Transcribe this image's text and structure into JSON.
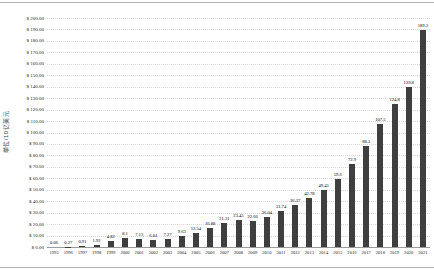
{
  "chart_data": {
    "type": "bar",
    "title": "",
    "xlabel": "",
    "ylabel": "单位/10亿美元",
    "categories": [
      "1995",
      "1996",
      "1997",
      "1998",
      "1999",
      "2000",
      "2001",
      "2002",
      "2003",
      "2004",
      "2005",
      "2006",
      "2007",
      "2008",
      "2009",
      "2010",
      "2011",
      "2012",
      "2013",
      "2014",
      "2015",
      "2016",
      "2017",
      "2018",
      "2019",
      "2020",
      "2021"
    ],
    "values": [
      0.06,
      0.27,
      0.91,
      1.92,
      4.82,
      8.1,
      7.13,
      6.01,
      7.27,
      9.63,
      12.54,
      16.88,
      21.31,
      23.45,
      22.66,
      26.04,
      31.74,
      36.37,
      42.78,
      49.45,
      59.6,
      72.9,
      88.3,
      107.5,
      124.8,
      139.8,
      189.3
    ],
    "value_labels": [
      "0.06",
      "0.27",
      "0.91",
      "1.92",
      "4.82",
      "8.1",
      "7.13",
      "6.01",
      "7.27",
      "9.63",
      "12.54",
      "16.88",
      "21.31",
      "23.45",
      "22.66",
      "26.04",
      "31.74",
      "36.37",
      "42.78",
      "49.45",
      "59.6",
      "72.9",
      "88.3",
      "107.5",
      "124.8",
      "139.8",
      "189.3"
    ],
    "ylim": [
      0,
      200
    ],
    "ytick_step": 10,
    "ytick_labels": [
      "$ 200.00",
      "$ 190.00",
      "$ 180.00",
      "$ 170.00",
      "$ 160.00",
      "$ 150.00",
      "$ 140.00",
      "$ 130.00",
      "$ 120.00",
      "$ 110.00",
      "$ 100.00",
      "$ 90.00",
      "$ 80.00",
      "$ 70.00",
      "$ 60.00",
      "$ 50.00",
      "$ 40.00",
      "$ 30.00",
      "$ 20.00",
      "$ 10.00",
      "$ 0.00"
    ],
    "grid": true,
    "legend_position": "none",
    "bar_color": "#3f3f3f",
    "gridline_color": "#d9d9d9",
    "background_color": "#ffffff"
  }
}
